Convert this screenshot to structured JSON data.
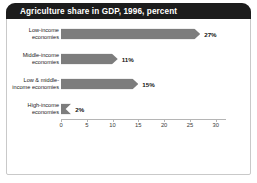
{
  "figure": {
    "title": "Agriculture share in GDP, 1996, percent",
    "title_bar_color": "#1c1c1c",
    "bar_color": "#7d7d7d",
    "frame_color": "#c9c9c9",
    "background": "#ffffff"
  },
  "chart_data": {
    "type": "bar",
    "orientation": "horizontal",
    "title": "Agriculture share in GDP, 1996, percent",
    "categories": [
      "Low-income economies",
      "Middle-income economies",
      "Low & middle-income economies",
      "High-income economies"
    ],
    "values": [
      27,
      11,
      15,
      2
    ],
    "data_labels": [
      "27%",
      "11%",
      "15%",
      "2%"
    ],
    "xlabel": "",
    "ylabel": "",
    "xlim": [
      0,
      32
    ],
    "xticks": [
      0,
      5,
      10,
      15,
      20,
      25,
      30
    ],
    "xtick_labels": [
      "0",
      "5",
      "10",
      "15",
      "20",
      "25",
      "30"
    ],
    "grid": false,
    "legend": false,
    "units": "percent"
  },
  "axis": {
    "ticks": [
      {
        "label": "0",
        "value": 0
      },
      {
        "label": "5",
        "value": 5
      },
      {
        "label": "10",
        "value": 10
      },
      {
        "label": "15",
        "value": 15
      },
      {
        "label": "20",
        "value": 20
      },
      {
        "label": "25",
        "value": 25
      },
      {
        "label": "30",
        "value": 30
      }
    ]
  },
  "bars": [
    {
      "label_line1": "Low-income",
      "label_line2": "economies",
      "value": 27,
      "value_label": "27%"
    },
    {
      "label_line1": "Middle-income",
      "label_line2": "economies",
      "value": 11,
      "value_label": "11%"
    },
    {
      "label_line1": "Low & middle-",
      "label_line2": "income economies",
      "value": 15,
      "value_label": "15%"
    },
    {
      "label_line1": "High-income",
      "label_line2": "economies",
      "value": 2,
      "value_label": "2%"
    }
  ]
}
